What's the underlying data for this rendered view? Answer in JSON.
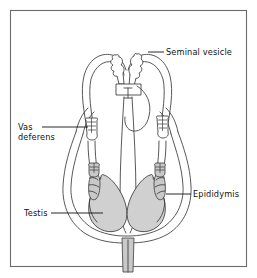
{
  "figure": {
    "kind": "anatomical-diagram",
    "border_color": "#6b6b6b",
    "background_color": "#ffffff",
    "line_color": "#3a3a3a",
    "testis_fill_color": "#d0d0d0",
    "epididymis_fill_color": "#c9c9c9"
  },
  "labels": [
    {
      "id": "seminal-vesicle",
      "text": "Seminal vesicle",
      "align": "start",
      "text_x": 166,
      "text_y": 55,
      "leader": [
        [
          148,
          52
        ],
        [
          164,
          52
        ]
      ]
    },
    {
      "id": "vas-deferens",
      "text_line_1": "Vas",
      "text_line_2": "deferens",
      "align": "start",
      "text_x": 18,
      "text_y": 130,
      "text_y_2": 140,
      "leader": [
        [
          42,
          127
        ],
        [
          88,
          127
        ]
      ]
    },
    {
      "id": "epididymis",
      "text": "Epididymis",
      "align": "start",
      "text_x": 193,
      "text_y": 197,
      "leader": [
        [
          166,
          194
        ],
        [
          191,
          194
        ]
      ]
    },
    {
      "id": "testis",
      "text": "Testis",
      "align": "start",
      "text_x": 24,
      "text_y": 216,
      "leader": [
        [
          51,
          213
        ],
        [
          103,
          213
        ]
      ]
    }
  ],
  "structures": [
    {
      "id": "frame",
      "name": "figure-border"
    },
    {
      "id": "scrotum-outline",
      "name": "scrotum-and-spermatic-cord-outline"
    },
    {
      "id": "vas-deferens-left",
      "name": "vas-deferens-left-loop"
    },
    {
      "id": "vas-deferens-right",
      "name": "vas-deferens-right-loop"
    },
    {
      "id": "seminal-vesicle-left",
      "name": "seminal-vesicle-left"
    },
    {
      "id": "seminal-vesicle-right",
      "name": "seminal-vesicle-right"
    },
    {
      "id": "prostate",
      "name": "prostate-gland"
    },
    {
      "id": "bladder",
      "name": "bladder-outline"
    },
    {
      "id": "urethra",
      "name": "urethra-penile-shaft"
    },
    {
      "id": "testis-left",
      "name": "testis-left"
    },
    {
      "id": "testis-right",
      "name": "testis-right"
    },
    {
      "id": "epididymis-left",
      "name": "epididymis-left"
    },
    {
      "id": "epididymis-right",
      "name": "epididymis-right"
    },
    {
      "id": "vas-cut-left",
      "name": "vas-deferens-cut-segment-left"
    },
    {
      "id": "vas-cut-right",
      "name": "vas-deferens-cut-segment-right"
    },
    {
      "id": "vas-lower-cut-left",
      "name": "vas-deferens-lower-cut-left"
    },
    {
      "id": "vas-lower-cut-right",
      "name": "vas-deferens-lower-cut-right"
    }
  ]
}
